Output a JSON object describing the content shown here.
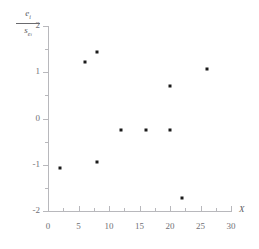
{
  "chart_data": {
    "type": "scatter",
    "title": "",
    "xlabel": "X",
    "ylabel": "e_i / s_{e_i}",
    "ylabel_numerator": "e",
    "ylabel_numerator_sub": "i",
    "ylabel_denominator": "s",
    "ylabel_denominator_sub": "e",
    "ylabel_denominator_subsub": "i",
    "xlim": [
      0,
      30
    ],
    "ylim": [
      -2,
      2
    ],
    "grid": false,
    "legend": null,
    "x_ticks": [
      0,
      5,
      10,
      15,
      20,
      25,
      30
    ],
    "x_tick_labels": [
      "0",
      "5",
      "10",
      "15",
      "20",
      "25",
      "30"
    ],
    "x_minor_ticks": [
      2.5,
      7.5,
      12.5,
      17.5,
      22.5,
      27.5
    ],
    "y_ticks": [
      2,
      1,
      0,
      -1,
      -2
    ],
    "y_tick_labels": [
      "2",
      "1",
      "0",
      "-1",
      "-2"
    ],
    "y_minor_ticks": [
      1.5,
      0.5,
      -0.5,
      -1.5
    ],
    "marker_color": "#1a1a1a",
    "axis_color": "#b8b8bc",
    "text_color": "#707074",
    "points": [
      {
        "x": 2,
        "y": -1.07
      },
      {
        "x": 6,
        "y": 1.22
      },
      {
        "x": 8,
        "y": 1.44
      },
      {
        "x": 8,
        "y": -0.95
      },
      {
        "x": 12,
        "y": -0.25
      },
      {
        "x": 16,
        "y": -0.25
      },
      {
        "x": 20,
        "y": 0.7
      },
      {
        "x": 20,
        "y": -0.25
      },
      {
        "x": 22,
        "y": -1.72
      },
      {
        "x": 26,
        "y": 1.07
      }
    ]
  }
}
